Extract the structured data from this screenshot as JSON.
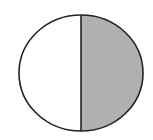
{
  "diagram": {
    "type": "fraction-circle",
    "parts_total": 2,
    "parts_shaded": 1,
    "shaded_side": "right",
    "colors": {
      "background": "#ffffff",
      "outline": "#222222",
      "shaded": "#b0b0b0",
      "unshaded": "#ffffff"
    },
    "geometry": {
      "cx": 81,
      "cy": 73,
      "rx": 62,
      "ry": 58,
      "stroke_width": 1.6
    }
  }
}
